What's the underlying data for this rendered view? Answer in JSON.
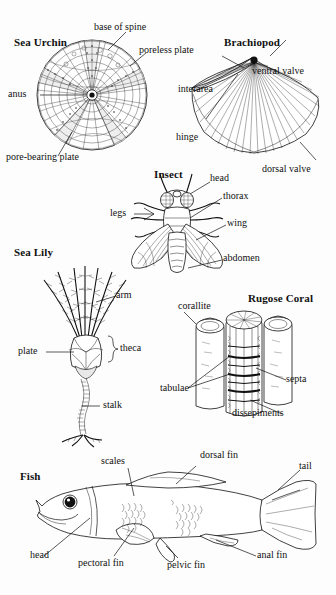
{
  "page": {
    "background_color": "#fdfdfd",
    "ink_color": "#111111",
    "width": 336,
    "height": 595
  },
  "figures": [
    {
      "id": "sea-urchin",
      "title": "Sea Urchin",
      "labels": [
        {
          "key": "base_of_spine",
          "text": "base of spine"
        },
        {
          "key": "poreless_plate",
          "text": "poreless plate"
        },
        {
          "key": "anus",
          "text": "anus"
        },
        {
          "key": "pore_bearing_plate",
          "text": "pore-bearing plate"
        }
      ]
    },
    {
      "id": "brachiopod",
      "title": "Brachiopod",
      "labels": [
        {
          "key": "ventral_valve",
          "text": "ventral valve"
        },
        {
          "key": "interarea",
          "text": "interarea"
        },
        {
          "key": "hinge",
          "text": "hinge"
        },
        {
          "key": "dorsal_valve",
          "text": "dorsal valve"
        }
      ]
    },
    {
      "id": "insect",
      "title": "Insect",
      "labels": [
        {
          "key": "head",
          "text": "head"
        },
        {
          "key": "thorax",
          "text": "thorax"
        },
        {
          "key": "legs",
          "text": "legs"
        },
        {
          "key": "wing",
          "text": "wing"
        },
        {
          "key": "abdomen",
          "text": "abdomen"
        }
      ]
    },
    {
      "id": "sea-lily",
      "title": "Sea Lily",
      "labels": [
        {
          "key": "arm",
          "text": "arm"
        },
        {
          "key": "plate",
          "text": "plate"
        },
        {
          "key": "theca",
          "text": "theca"
        },
        {
          "key": "stalk",
          "text": "stalk"
        }
      ]
    },
    {
      "id": "rugose-coral",
      "title": "Rugose Coral",
      "labels": [
        {
          "key": "corallite",
          "text": "corallite"
        },
        {
          "key": "tabulae",
          "text": "tabulae"
        },
        {
          "key": "septa",
          "text": "septa"
        },
        {
          "key": "dissepiments",
          "text": "dissepiments"
        }
      ]
    },
    {
      "id": "fish",
      "title": "Fish",
      "labels": [
        {
          "key": "scales",
          "text": "scales"
        },
        {
          "key": "dorsal_fin",
          "text": "dorsal fin"
        },
        {
          "key": "tail",
          "text": "tail"
        },
        {
          "key": "head",
          "text": "head"
        },
        {
          "key": "pectoral_fin",
          "text": "pectoral fin"
        },
        {
          "key": "pelvic_fin",
          "text": "pelvic fin"
        },
        {
          "key": "anal_fin",
          "text": "anal fin"
        }
      ]
    }
  ],
  "sea_urchin": {
    "title": "Sea Urchin",
    "base_of_spine": "base of spine",
    "poreless_plate": "poreless plate",
    "anus": "anus",
    "pore_bearing_plate": "pore-bearing plate"
  },
  "brachiopod": {
    "title": "Brachiopod",
    "ventral_valve": "ventral valve",
    "interarea": "interarea",
    "hinge": "hinge",
    "dorsal_valve": "dorsal valve"
  },
  "insect": {
    "title": "Insect",
    "head": "head",
    "thorax": "thorax",
    "legs": "legs",
    "wing": "wing",
    "abdomen": "abdomen"
  },
  "sea_lily": {
    "title": "Sea Lily",
    "arm": "arm",
    "plate": "plate",
    "theca": "theca",
    "stalk": "stalk"
  },
  "rugose_coral": {
    "title": "Rugose Coral",
    "corallite": "corallite",
    "tabulae": "tabulae",
    "septa": "septa",
    "dissepiments": "dissepiments"
  },
  "fish": {
    "title": "Fish",
    "scales": "scales",
    "dorsal_fin": "dorsal fin",
    "tail": "tail",
    "head": "head",
    "pectoral_fin": "pectoral fin",
    "pelvic_fin": "pelvic fin",
    "anal_fin": "anal fin"
  }
}
